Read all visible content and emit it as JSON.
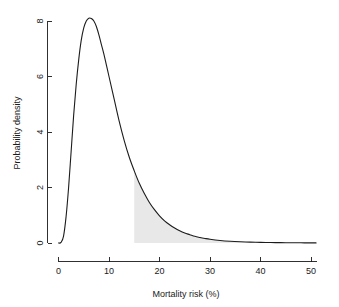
{
  "chart_data": {
    "type": "area",
    "title": "",
    "subtitle": "",
    "xlabel": "Mortality risk (%)",
    "ylabel": "Probability density",
    "xlim": [
      0,
      51
    ],
    "ylim": [
      0,
      8.4
    ],
    "xticks": [
      0,
      10,
      20,
      30,
      40,
      50
    ],
    "xtick_labels": [
      "0",
      "10",
      "20",
      "30",
      "40",
      "50"
    ],
    "yticks": [
      0,
      2,
      4,
      6,
      8
    ],
    "ytick_labels": [
      "0",
      "2",
      "4",
      "6",
      "8"
    ],
    "grid": false,
    "legend": null,
    "curve_color": "#1c1c1c",
    "shade_color": "#e8e8e8",
    "axis_color": "#1a1a1a",
    "background_color": "#ffffff",
    "series": [
      {
        "name": "Probability density",
        "x": [
          0.0,
          0.5,
          1.0,
          1.5,
          2.0,
          2.5,
          3.0,
          3.5,
          4.0,
          4.5,
          5.0,
          5.5,
          6.0,
          6.5,
          7.0,
          7.5,
          8.0,
          8.5,
          9.0,
          9.5,
          10.0,
          11.0,
          12.0,
          13.0,
          14.0,
          15.0,
          16.0,
          17.0,
          18.0,
          19.0,
          20.0,
          21.0,
          22.0,
          23.0,
          24.0,
          25.0,
          26.0,
          27.0,
          28.0,
          29.0,
          30.0,
          32.0,
          34.0,
          36.0,
          38.0,
          40.0,
          42.0,
          44.0,
          46.0,
          48.0,
          50.0,
          51.0
        ],
        "y": [
          0.0,
          0.02,
          0.25,
          0.95,
          2.0,
          3.3,
          4.6,
          5.7,
          6.6,
          7.3,
          7.75,
          8.0,
          8.1,
          8.09,
          8.0,
          7.8,
          7.5,
          7.15,
          6.8,
          6.4,
          6.0,
          5.2,
          4.4,
          3.7,
          3.1,
          2.6,
          2.15,
          1.78,
          1.46,
          1.2,
          0.98,
          0.8,
          0.66,
          0.54,
          0.44,
          0.36,
          0.3,
          0.24,
          0.2,
          0.165,
          0.135,
          0.092,
          0.063,
          0.044,
          0.031,
          0.022,
          0.016,
          0.012,
          0.009,
          0.007,
          0.005,
          0.004
        ]
      }
    ],
    "shaded_region": {
      "label": "tail probability region",
      "x_start": 15.0,
      "x_end": 51.0,
      "y_at_start": 2.6,
      "fill": "#e8e8e8"
    },
    "peak": {
      "x": 6.2,
      "y": 8.1
    }
  }
}
